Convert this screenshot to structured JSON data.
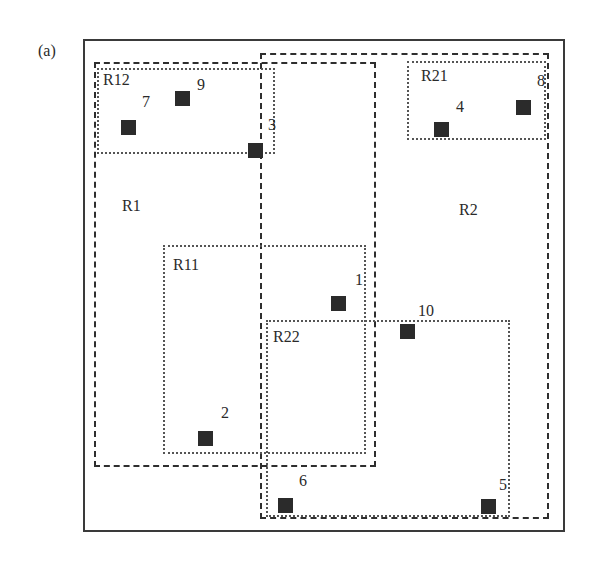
{
  "figure": {
    "panel_label": "(a)",
    "frame": {
      "x": 83,
      "y": 39,
      "w": 482,
      "h": 493
    },
    "colors": {
      "stroke": "#2e2e2e",
      "point": "#2b2b2b",
      "background": "#ffffff"
    }
  },
  "regions": [
    {
      "id": "R1",
      "label": "R1",
      "style": "dashed",
      "x": 94,
      "y": 62,
      "w": 282,
      "h": 405,
      "label_x": 122,
      "label_y": 198
    },
    {
      "id": "R2",
      "label": "R2",
      "style": "dashed",
      "x": 260,
      "y": 53,
      "w": 289,
      "h": 466,
      "label_x": 459,
      "label_y": 202
    },
    {
      "id": "R12",
      "label": "R12",
      "style": "dotted",
      "x": 97,
      "y": 68,
      "w": 178,
      "h": 86,
      "label_x": 103,
      "label_y": 72
    },
    {
      "id": "R21",
      "label": "R21",
      "style": "dotted",
      "x": 407,
      "y": 61,
      "w": 139,
      "h": 79,
      "label_x": 421,
      "label_y": 68
    },
    {
      "id": "R11",
      "label": "R11",
      "style": "dotted",
      "x": 163,
      "y": 245,
      "w": 203,
      "h": 209,
      "label_x": 173,
      "label_y": 257
    },
    {
      "id": "R22",
      "label": "R22",
      "style": "dotted",
      "x": 266,
      "y": 320,
      "w": 244,
      "h": 197,
      "label_x": 273,
      "label_y": 329
    }
  ],
  "points": [
    {
      "id": "1",
      "label": "1",
      "x": 338,
      "y": 303,
      "label_x": 355,
      "label_y": 272
    },
    {
      "id": "2",
      "label": "2",
      "x": 205,
      "y": 438,
      "label_x": 221,
      "label_y": 405
    },
    {
      "id": "3",
      "label": "3",
      "x": 255,
      "y": 150,
      "label_x": 268,
      "label_y": 117
    },
    {
      "id": "4",
      "label": "4",
      "x": 441,
      "y": 129,
      "label_x": 456,
      "label_y": 99
    },
    {
      "id": "5",
      "label": "5",
      "x": 488,
      "y": 506,
      "label_x": 499,
      "label_y": 477
    },
    {
      "id": "6",
      "label": "6",
      "x": 285,
      "y": 505,
      "label_x": 299,
      "label_y": 473
    },
    {
      "id": "7",
      "label": "7",
      "x": 128,
      "y": 127,
      "label_x": 142,
      "label_y": 94
    },
    {
      "id": "8",
      "label": "8",
      "x": 523,
      "y": 107,
      "label_x": 537,
      "label_y": 73
    },
    {
      "id": "9",
      "label": "9",
      "x": 182,
      "y": 98,
      "label_x": 197,
      "label_y": 77
    },
    {
      "id": "10",
      "label": "10",
      "x": 407,
      "y": 331,
      "label_x": 418,
      "label_y": 303
    }
  ]
}
